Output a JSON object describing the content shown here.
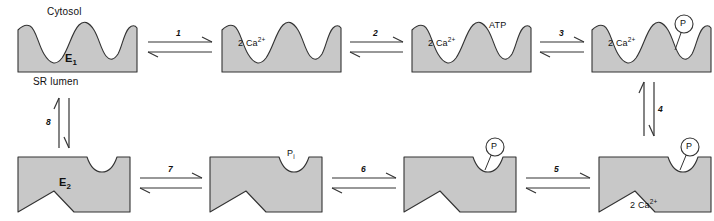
{
  "figure": {
    "background_color": "#ffffff",
    "protein_fill_color": "#c8c8c8",
    "protein_stroke_color": "#333333",
    "text_color": "#111111"
  },
  "boundary_labels": {
    "top": "Cytosol",
    "bottom": "SR lumen"
  },
  "enzyme_states": {
    "e1": "E<sub>1</sub>",
    "e2": "E<sub>2</sub>"
  },
  "ligands": {
    "calcium": "2 Ca<sup>2+</sup>",
    "atp": "ATP",
    "phosphate_inorganic": "P<sub>i</sub>",
    "phosphate_bound": "P"
  },
  "steps": [
    {
      "number": "1",
      "orientation": "horizontal-right",
      "row": "top"
    },
    {
      "number": "2",
      "orientation": "horizontal-right",
      "row": "top"
    },
    {
      "number": "3",
      "orientation": "horizontal-right",
      "row": "top"
    },
    {
      "number": "4",
      "orientation": "vertical-down",
      "row": "right"
    },
    {
      "number": "5",
      "orientation": "horizontal-left",
      "row": "bottom"
    },
    {
      "number": "6",
      "orientation": "horizontal-left",
      "row": "bottom"
    },
    {
      "number": "7",
      "orientation": "horizontal-left",
      "row": "bottom"
    },
    {
      "number": "8",
      "orientation": "vertical-up",
      "row": "left"
    }
  ],
  "top_row": [
    {
      "id": "state-e1",
      "shape": "cytosol-open-wavy",
      "enzyme_label": "E1",
      "ligand_labels": []
    },
    {
      "id": "state-e1-2ca",
      "shape": "cytosol-open-wavy",
      "enzyme_label": "",
      "ligand_labels": [
        "2 Ca2+"
      ]
    },
    {
      "id": "state-e1-2ca-atp",
      "shape": "cytosol-open-wavy",
      "enzyme_label": "",
      "ligand_labels": [
        "2 Ca2+",
        "ATP"
      ]
    },
    {
      "id": "state-e1p-2ca",
      "shape": "cytosol-open-wavy",
      "enzyme_label": "",
      "ligand_labels": [
        "2 Ca2+",
        "P"
      ]
    }
  ],
  "bottom_row": [
    {
      "id": "state-e2",
      "shape": "lumen-open-angular",
      "enzyme_label": "E2",
      "ligand_labels": []
    },
    {
      "id": "state-e2-pi",
      "shape": "lumen-open-angular",
      "enzyme_label": "",
      "ligand_labels": [
        "Pi"
      ]
    },
    {
      "id": "state-e2p",
      "shape": "lumen-open-angular",
      "enzyme_label": "",
      "ligand_labels": [
        "P"
      ]
    },
    {
      "id": "state-e2p-2ca-release",
      "shape": "lumen-open-angular",
      "enzyme_label": "",
      "ligand_labels": [
        "P",
        "2 Ca2+"
      ]
    }
  ]
}
